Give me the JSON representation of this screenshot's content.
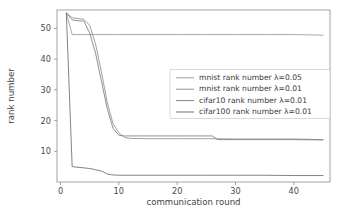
{
  "chart_data": {
    "type": "line",
    "title": "",
    "xlabel": "communication round",
    "ylabel": "rank number",
    "xlim": [
      -0.6,
      46.2
    ],
    "ylim": [
      0.0,
      56.0
    ],
    "xticks": [
      0,
      10,
      20,
      30,
      40
    ],
    "xtick_labels": [
      "0",
      "10",
      "20",
      "30",
      "40"
    ],
    "yticks": [
      10,
      20,
      30,
      40,
      50
    ],
    "ytick_labels": [
      "10",
      "20",
      "30",
      "40",
      "50"
    ],
    "grid": false,
    "legend_position": "upper right",
    "series": [
      {
        "name": "mnist rank number λ=0.05",
        "color": "#9a9a9a",
        "x": [
          1,
          2,
          3,
          4,
          5,
          10,
          15,
          20,
          25,
          30,
          35,
          40,
          45
        ],
        "values": [
          55,
          48,
          48,
          48,
          48,
          48,
          48,
          48,
          48,
          48,
          48,
          48,
          47.8
        ]
      },
      {
        "name": "mnist rank number λ=0.01",
        "color": "#8f8f8f",
        "x": [
          1,
          2,
          3,
          4,
          5,
          6,
          7,
          8,
          9,
          10,
          11,
          12,
          15,
          20,
          25,
          30,
          35,
          40,
          45
        ],
        "values": [
          55,
          53.5,
          53.2,
          53,
          51,
          45,
          36,
          26,
          19,
          16,
          14.5,
          14.2,
          14.1,
          14.1,
          14.1,
          14.0,
          14.0,
          14.0,
          13.8
        ]
      },
      {
        "name": "cifar10 rank number λ=0.01",
        "color": "#7d7d7d",
        "x": [
          1,
          2,
          3,
          4,
          5,
          6,
          7,
          8,
          9,
          10,
          11,
          12,
          15,
          20,
          25,
          26,
          27,
          30,
          35,
          40,
          45
        ],
        "values": [
          55,
          52.8,
          52.5,
          52.4,
          48.5,
          42,
          33,
          24,
          17.5,
          15.2,
          15.0,
          15.0,
          15.0,
          15.0,
          15.0,
          15.0,
          13.8,
          13.8,
          13.8,
          13.8,
          13.7
        ]
      },
      {
        "name": "cifar100 rank number λ=0.01",
        "color": "#6b6b6b",
        "x": [
          1,
          2,
          3,
          4,
          5,
          6,
          7,
          8,
          9,
          10,
          15,
          20,
          25,
          30,
          35,
          40,
          45
        ],
        "values": [
          55,
          5.0,
          4.8,
          4.6,
          4.4,
          4.0,
          3.6,
          2.6,
          2.3,
          2.2,
          2.2,
          2.2,
          2.2,
          2.2,
          2.2,
          2.1,
          2.1
        ]
      }
    ]
  },
  "legend": {
    "entries": [
      "mnist rank number λ=0.05",
      "mnist rank number λ=0.01",
      "cifar10 rank number λ=0.01",
      "cifar100 rank number λ=0.01"
    ]
  },
  "axes": {
    "x_title": "communication round",
    "y_title": "rank number"
  }
}
